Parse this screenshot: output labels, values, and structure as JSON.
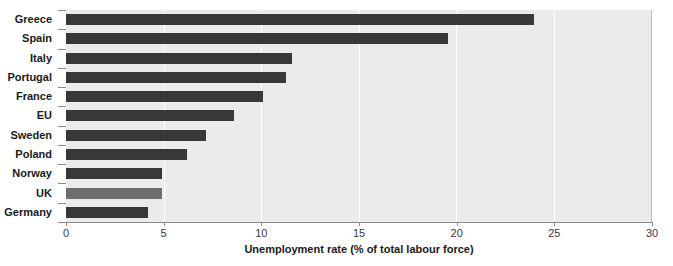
{
  "chart_data": {
    "type": "bar",
    "orientation": "horizontal",
    "title": "",
    "xlabel": "Unemployment rate (% of total labour force)",
    "ylabel": "",
    "xlim": [
      0,
      30
    ],
    "xticks": [
      0,
      5,
      10,
      15,
      20,
      25,
      30
    ],
    "xtick_labels": [
      "0",
      "5",
      "10",
      "15",
      "20",
      "25",
      "30"
    ],
    "grid": true,
    "grid_axis": "x",
    "legend": false,
    "categories": [
      "Greece",
      "Spain",
      "Italy",
      "Portugal",
      "France",
      "EU",
      "Sweden",
      "Poland",
      "Norway",
      "UK",
      "Germany"
    ],
    "values": [
      24.0,
      19.6,
      11.6,
      11.3,
      10.1,
      8.6,
      7.2,
      6.2,
      4.9,
      4.9,
      4.2
    ],
    "highlight_category": "UK",
    "colors": {
      "bar": "#383838",
      "bar_highlight": "#6e6e6e",
      "plot_background": "#ebebeb",
      "gridline": "#ffffff",
      "axis": "#8a8a8a",
      "text": "#1a1a1a",
      "tick_text": "#3a3a3a",
      "page_background": "#ffffff"
    }
  }
}
